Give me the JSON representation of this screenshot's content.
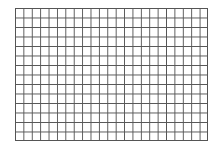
{
  "grid": {
    "columns": 23,
    "rows": 14,
    "line_color": "#555555",
    "background_color": "#ffffff"
  }
}
